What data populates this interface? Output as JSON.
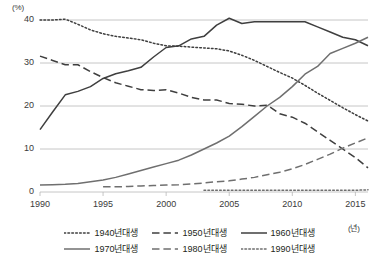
{
  "chart_data": {
    "type": "line",
    "title": "",
    "xlabel": "(년)",
    "ylabel": "(%)",
    "xlim": [
      1990,
      2016
    ],
    "ylim": [
      0,
      42
    ],
    "yticks": [
      0,
      10,
      20,
      30,
      40
    ],
    "xticks": [
      1990,
      1995,
      2000,
      2005,
      2010,
      2015
    ],
    "grid": "horizontal",
    "legend_position": "bottom",
    "x": [
      1990,
      1991,
      1992,
      1993,
      1994,
      1995,
      1996,
      1997,
      1998,
      1999,
      2000,
      2001,
      2002,
      2003,
      2004,
      2005,
      2006,
      2007,
      2008,
      2009,
      2010,
      2011,
      2012,
      2013,
      2014,
      2015,
      2016
    ],
    "series": [
      {
        "name": "1940년대생",
        "style": "dotted",
        "color": "#3f3f3f",
        "values": [
          40.0,
          40.0,
          40.2,
          39.0,
          37.7,
          36.8,
          36.2,
          35.8,
          35.4,
          34.6,
          34.0,
          33.9,
          33.7,
          33.5,
          33.3,
          32.8,
          31.8,
          30.6,
          29.2,
          27.8,
          26.5,
          24.8,
          23.0,
          21.3,
          19.6,
          18.0,
          16.5
        ]
      },
      {
        "name": "1950년대생",
        "style": "dashed",
        "color": "#3f3f3f",
        "values": [
          31.6,
          30.6,
          29.6,
          29.6,
          28.0,
          26.6,
          25.4,
          24.6,
          23.8,
          23.6,
          23.8,
          23.0,
          22.0,
          21.4,
          21.4,
          20.6,
          20.4,
          20.0,
          20.2,
          18.2,
          17.4,
          16.0,
          14.0,
          12.0,
          10.0,
          8.0,
          5.6
        ]
      },
      {
        "name": "1960년대생",
        "style": "solid",
        "color": "#3f3f3f",
        "values": [
          14.5,
          18.6,
          22.6,
          23.4,
          24.5,
          26.4,
          27.5,
          28.2,
          29.0,
          31.4,
          33.6,
          34.0,
          35.6,
          36.2,
          38.8,
          40.4,
          39.2,
          39.6,
          39.6,
          39.6,
          39.6,
          39.6,
          38.4,
          37.2,
          36.0,
          35.4,
          34.0
        ]
      },
      {
        "name": "1970년대생",
        "style": "solid",
        "color": "#6f6f6f",
        "values": [
          1.6,
          1.7,
          1.8,
          2.0,
          2.4,
          2.8,
          3.4,
          4.2,
          5.0,
          5.8,
          6.6,
          7.4,
          8.6,
          10.0,
          11.4,
          13.0,
          15.2,
          17.6,
          20.0,
          22.0,
          24.5,
          27.4,
          29.2,
          32.2,
          33.4,
          34.6,
          36.0
        ]
      },
      {
        "name": "1980년대생",
        "style": "dashed",
        "color": "#6f6f6f",
        "values": [
          null,
          null,
          null,
          null,
          null,
          1.2,
          1.2,
          1.3,
          1.4,
          1.5,
          1.6,
          1.7,
          1.9,
          2.1,
          2.4,
          2.6,
          3.0,
          3.4,
          4.0,
          4.6,
          5.4,
          6.4,
          7.6,
          8.8,
          10.2,
          11.4,
          12.6
        ]
      },
      {
        "name": "1990년대생",
        "style": "dotted",
        "color": "#6f6f6f",
        "values": [
          null,
          null,
          null,
          null,
          null,
          null,
          null,
          null,
          null,
          null,
          null,
          null,
          null,
          0.4,
          0.4,
          0.4,
          0.4,
          0.4,
          0.4,
          0.4,
          0.4,
          0.4,
          0.4,
          0.4,
          0.4,
          0.4,
          0.5
        ]
      }
    ]
  },
  "axes": {
    "y_unit": "(%)",
    "x_unit": "(년)",
    "y_tick_labels": [
      "40",
      "30",
      "20",
      "10",
      "0"
    ],
    "x_tick_labels": [
      "1990",
      "1995",
      "2000",
      "2005",
      "2010",
      "2015"
    ]
  },
  "legend": {
    "rows": [
      [
        {
          "label": "1940년대생",
          "style": "dotted",
          "color": "#3f3f3f"
        },
        {
          "label": "1950년대생",
          "style": "dashed",
          "color": "#3f3f3f"
        },
        {
          "label": "1960년대생",
          "style": "solid",
          "color": "#3f3f3f"
        }
      ],
      [
        {
          "label": "1970년대생",
          "style": "solid",
          "color": "#6f6f6f"
        },
        {
          "label": "1980년대생",
          "style": "dashed",
          "color": "#6f6f6f"
        },
        {
          "label": "1990년대생",
          "style": "dotted",
          "color": "#6f6f6f"
        }
      ]
    ]
  }
}
